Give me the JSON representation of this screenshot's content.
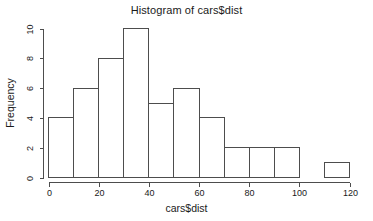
{
  "chart_data": {
    "type": "bar",
    "title": "Histogram of cars$dist",
    "xlabel": "cars$dist",
    "ylabel": "Frequency",
    "bin_width": 10,
    "bin_edges": [
      0,
      10,
      20,
      30,
      40,
      50,
      60,
      70,
      80,
      90,
      100,
      110,
      120
    ],
    "categories": [
      "0-10",
      "10-20",
      "20-30",
      "30-40",
      "40-50",
      "50-60",
      "60-70",
      "70-80",
      "80-90",
      "90-100",
      "100-110",
      "110-120"
    ],
    "values": [
      4,
      6,
      8,
      10,
      5,
      6,
      4,
      2,
      2,
      2,
      0,
      1
    ],
    "xlim": [
      0,
      120
    ],
    "ylim": [
      0,
      10
    ],
    "xticks": [
      0,
      20,
      40,
      60,
      80,
      100,
      120
    ],
    "xtick_labels": [
      "0",
      "20",
      "40",
      "60",
      "80",
      "100",
      "120"
    ],
    "yticks": [
      0,
      2,
      4,
      6,
      8,
      10
    ],
    "ytick_labels": [
      "0",
      "2",
      "4",
      "6",
      "8",
      "10"
    ],
    "grid": false,
    "legend": "none",
    "bar_fill_color": "#ffffff",
    "bar_border_color": "#4d4d4d",
    "axis_color": "#4d4d4d",
    "text_color": "#1a1a1a",
    "background_color": "#ffffff",
    "total_count": 50
  }
}
